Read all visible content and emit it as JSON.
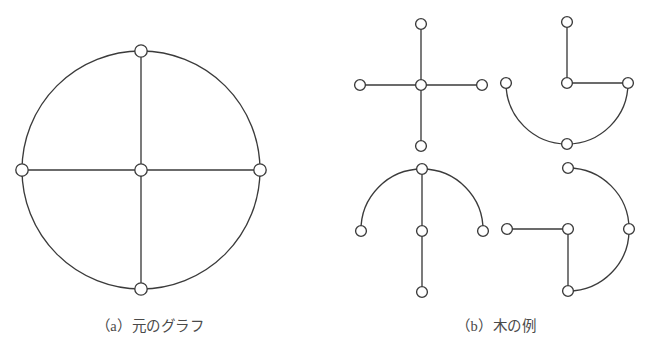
{
  "figure": {
    "background_color": "#ffffff",
    "stroke_color": "#3b3b3b",
    "node_fill_color": "#ffffff",
    "caption_color": "#4a4a4a",
    "panels": [
      {
        "id": "panel-a",
        "caption": "（a）元のグラフ",
        "caption_label": "(a)",
        "caption_text": "元のグラフ",
        "description": "original-graph",
        "circle": {
          "cx": 141,
          "cy": 170,
          "r": 119
        },
        "nodes": [
          {
            "name": "center",
            "cx": 141,
            "cy": 170,
            "r": 6.2
          },
          {
            "name": "top",
            "cx": 141,
            "cy": 51,
            "r": 6.2
          },
          {
            "name": "bottom",
            "cx": 141,
            "cy": 289,
            "r": 6.2
          },
          {
            "name": "left",
            "cx": 22,
            "cy": 170,
            "r": 6.2
          },
          {
            "name": "right",
            "cx": 260,
            "cy": 170,
            "r": 6.2
          }
        ],
        "straight_edges": [
          {
            "from": "top",
            "to": "center"
          },
          {
            "from": "center",
            "to": "bottom"
          },
          {
            "from": "left",
            "to": "center"
          },
          {
            "from": "center",
            "to": "right"
          }
        ],
        "arc_edges": [
          {
            "from": "top",
            "to": "right",
            "sweep": 1
          },
          {
            "from": "right",
            "to": "bottom",
            "sweep": 1
          },
          {
            "from": "bottom",
            "to": "left",
            "sweep": 1
          },
          {
            "from": "left",
            "to": "top",
            "sweep": 1
          }
        ]
      },
      {
        "id": "panel-b",
        "caption": "（b）木の例",
        "caption_label": "(b)",
        "caption_text": "木の例",
        "description": "tree-examples",
        "trees": [
          {
            "name": "tree-top-left",
            "r": 61,
            "nodes": [
              {
                "name": "center",
                "cx": 421,
                "cy": 85,
                "r": 5.4
              },
              {
                "name": "top",
                "cx": 421,
                "cy": 24,
                "r": 5.4
              },
              {
                "name": "bottom",
                "cx": 421,
                "cy": 146,
                "r": 5.4
              },
              {
                "name": "left",
                "cx": 360,
                "cy": 85,
                "r": 5.4
              },
              {
                "name": "right",
                "cx": 482,
                "cy": 85,
                "r": 5.4
              }
            ],
            "straight_edges": [
              {
                "from": "top",
                "to": "center"
              },
              {
                "from": "center",
                "to": "bottom"
              },
              {
                "from": "left",
                "to": "center"
              },
              {
                "from": "center",
                "to": "right"
              }
            ],
            "arc_edges": []
          },
          {
            "name": "tree-top-right",
            "r": 61,
            "nodes": [
              {
                "name": "center",
                "cx": 567,
                "cy": 83,
                "r": 5.4
              },
              {
                "name": "top",
                "cx": 567,
                "cy": 22,
                "r": 5.4
              },
              {
                "name": "bottom",
                "cx": 567,
                "cy": 144,
                "r": 5.4
              },
              {
                "name": "left",
                "cx": 506,
                "cy": 83,
                "r": 5.4
              },
              {
                "name": "right",
                "cx": 628,
                "cy": 83,
                "r": 5.4
              }
            ],
            "straight_edges": [
              {
                "from": "top",
                "to": "center"
              },
              {
                "from": "center",
                "to": "right"
              }
            ],
            "arc_edges": [
              {
                "from": "left",
                "to": "bottom",
                "sweep": 0
              },
              {
                "from": "bottom",
                "to": "right",
                "sweep": 0
              }
            ]
          },
          {
            "name": "tree-bottom-left",
            "r": 61,
            "nodes": [
              {
                "name": "center",
                "cx": 422,
                "cy": 231,
                "r": 5.4
              },
              {
                "name": "top",
                "cx": 422,
                "cy": 169,
                "r": 5.4
              },
              {
                "name": "bottom",
                "cx": 422,
                "cy": 292,
                "r": 5.4
              },
              {
                "name": "left",
                "cx": 361,
                "cy": 231,
                "r": 5.4
              },
              {
                "name": "right",
                "cx": 483,
                "cy": 231,
                "r": 5.4
              }
            ],
            "straight_edges": [
              {
                "from": "top",
                "to": "center"
              },
              {
                "from": "center",
                "to": "bottom"
              }
            ],
            "arc_edges": [
              {
                "from": "left",
                "to": "top",
                "sweep": 1
              },
              {
                "from": "top",
                "to": "right",
                "sweep": 1
              }
            ]
          },
          {
            "name": "tree-bottom-right",
            "r": 61,
            "nodes": [
              {
                "name": "center",
                "cx": 568,
                "cy": 229,
                "r": 5.4
              },
              {
                "name": "top",
                "cx": 568,
                "cy": 168,
                "r": 5.4
              },
              {
                "name": "bottom",
                "cx": 568,
                "cy": 291,
                "r": 5.4
              },
              {
                "name": "left",
                "cx": 507,
                "cy": 229,
                "r": 5.4
              },
              {
                "name": "right",
                "cx": 629,
                "cy": 229,
                "r": 5.4
              }
            ],
            "straight_edges": [
              {
                "from": "left",
                "to": "center"
              },
              {
                "from": "center",
                "to": "bottom"
              }
            ],
            "arc_edges": [
              {
                "from": "top",
                "to": "right",
                "sweep": 1
              },
              {
                "from": "right",
                "to": "bottom",
                "sweep": 1
              }
            ]
          }
        ]
      }
    ]
  }
}
